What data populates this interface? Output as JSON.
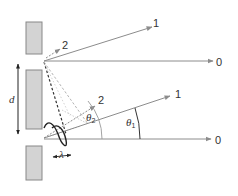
{
  "diagram": {
    "type": "double-slit diffraction",
    "colors": {
      "barrier_fill": "#d3d3d3",
      "barrier_stroke": "#888888",
      "ray": "#8c8c8c",
      "dark_dash": "#333333",
      "light_dash": "#b5b5b5",
      "wave": "#222222",
      "text": "#333333"
    },
    "labels": {
      "upper_order_0": "0",
      "upper_order_1": "1",
      "upper_order_2": "2",
      "lower_order_0": "0",
      "lower_order_1": "1",
      "lower_order_2": "2",
      "theta1": "θ",
      "theta1_sub": "1",
      "theta2": "θ",
      "theta2_sub": "2",
      "slit_separation": "d",
      "wavelength": "λ"
    }
  }
}
